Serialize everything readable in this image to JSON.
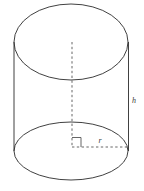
{
  "figure": {
    "name": "cylinder-diagram",
    "background_color": "#ffffff",
    "stroke_color": "#2b2b2b",
    "dash_color": "#555555",
    "label_color": "#3a3a3a"
  },
  "labels": {
    "height": "h",
    "radius": "r"
  },
  "geometry": {
    "top_ellipse": {
      "cx": 71,
      "cy": 42,
      "rx": 57,
      "ry": 38
    },
    "bottom_ellipse": {
      "cx": 71,
      "cy": 151,
      "rx": 57,
      "ry": 29
    },
    "left_edge": {
      "x": 14,
      "y1": 42,
      "y2": 151
    },
    "right_edge": {
      "x": 128,
      "y1": 42,
      "y2": 151
    },
    "axis_dashed": {
      "x": 72,
      "y1": 42,
      "y2": 147
    },
    "radius_dashed": {
      "y": 147,
      "x1": 72,
      "x2": 128
    },
    "right_angle_marker": {
      "x": 72,
      "y": 137,
      "size": 9
    },
    "height_label_pos": {
      "x": 134,
      "y": 103
    },
    "radius_label_pos": {
      "x": 100,
      "y": 143
    }
  }
}
